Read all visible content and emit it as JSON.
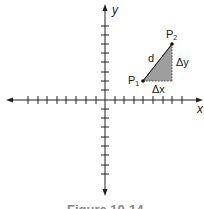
{
  "figure": {
    "caption": "Figure 10-14",
    "axes": {
      "x_label": "x",
      "y_label": "y"
    },
    "points": {
      "p1_label": "P",
      "p1_sub": "1",
      "p2_label": "P",
      "p2_sub": "2"
    },
    "segment_label": "d",
    "delta_x_label": "Δx",
    "delta_y_label": "Δy",
    "colors": {
      "axis": "#222222",
      "triangle_fill": "#9e9e9e",
      "caption": "#8a8a8a"
    }
  }
}
